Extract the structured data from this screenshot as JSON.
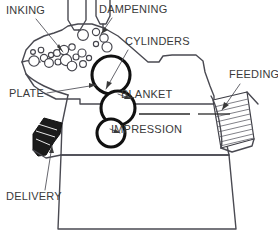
{
  "diagram": {
    "background_color": "#ffffff",
    "line_color": "#4a4a52",
    "cylinder_color": "#111111",
    "label_color": "#3a3a3a",
    "width": 278,
    "height": 231
  },
  "labels": {
    "inking": "INKING",
    "dampening": "DAMPENING",
    "cylinders": "CYLINDERS",
    "feeding": "FEEDING",
    "plate": "PLATE",
    "blanket": "BLANKET",
    "impression": "IMPRESSION",
    "delivery": "DELIVERY"
  },
  "label_positions": {
    "inking": {
      "x": 6,
      "y": 14
    },
    "dampening": {
      "x": 99,
      "y": 13
    },
    "cylinders": {
      "x": 125,
      "y": 45
    },
    "feeding": {
      "x": 229,
      "y": 78
    },
    "plate": {
      "x": 9,
      "y": 97
    },
    "blanket": {
      "x": 121,
      "y": 98
    },
    "impression": {
      "x": 111,
      "y": 133
    },
    "delivery": {
      "x": 6,
      "y": 200
    }
  },
  "cylinders": [
    {
      "name": "plate-cylinder",
      "cx": 111,
      "cy": 75,
      "r": 19
    },
    {
      "name": "blanket-cylinder",
      "cx": 118,
      "cy": 108,
      "r": 17
    },
    {
      "name": "impression-cylinder",
      "cx": 111,
      "cy": 133,
      "r": 14
    }
  ],
  "ink_rollers": [
    {
      "cx": 34,
      "cy": 61,
      "r": 5.2
    },
    {
      "cx": 44,
      "cy": 58,
      "r": 3.6
    },
    {
      "cx": 51,
      "cy": 55,
      "r": 2.6
    },
    {
      "cx": 57,
      "cy": 53,
      "r": 3.4
    },
    {
      "cx": 64,
      "cy": 50,
      "r": 4.6
    },
    {
      "cx": 72,
      "cy": 47,
      "r": 3.2
    },
    {
      "cx": 49,
      "cy": 63,
      "r": 4.4
    },
    {
      "cx": 58,
      "cy": 62,
      "r": 3.0
    },
    {
      "cx": 66,
      "cy": 60,
      "r": 5.6
    },
    {
      "cx": 76,
      "cy": 57,
      "r": 3.0
    },
    {
      "cx": 82,
      "cy": 53,
      "r": 4.0
    },
    {
      "cx": 72,
      "cy": 66,
      "r": 4.8
    },
    {
      "cx": 83,
      "cy": 64,
      "r": 3.4
    },
    {
      "cx": 41,
      "cy": 50,
      "r": 2.8
    },
    {
      "cx": 33,
      "cy": 52,
      "r": 2.4
    },
    {
      "cx": 89,
      "cy": 58,
      "r": 2.6
    }
  ],
  "damp_rollers": [
    {
      "cx": 83,
      "cy": 35,
      "r": 5.4
    },
    {
      "cx": 96,
      "cy": 32,
      "r": 3.6
    },
    {
      "cx": 104,
      "cy": 38,
      "r": 4.2
    },
    {
      "cx": 107,
      "cy": 47,
      "r": 5.0
    },
    {
      "cx": 96,
      "cy": 44,
      "r": 2.6
    }
  ],
  "paper_stacks": {
    "feeding": {
      "name": "feed-pile",
      "hatch_lines": 9
    },
    "delivery": {
      "name": "delivery-pile",
      "shade": "#1b1b1b"
    }
  }
}
